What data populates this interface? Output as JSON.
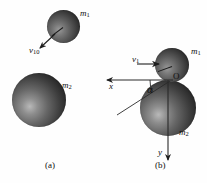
{
  "figure": {
    "type": "physics-collision-diagram"
  },
  "panel_a": {
    "caption": "(a)",
    "bodies": [
      {
        "id": "m1",
        "label": "m",
        "subscript": "1",
        "role": "small-sphere-upper-right"
      },
      {
        "id": "m2",
        "label": "m",
        "subscript": "2",
        "role": "large-sphere-lower-left"
      }
    ],
    "vectors": [
      {
        "id": "v10",
        "label": "v",
        "subscript": "10",
        "direction": "down-left",
        "from": "m1"
      }
    ]
  },
  "panel_b": {
    "caption": "(b)",
    "bodies": [
      {
        "id": "m1",
        "label": "m",
        "subscript": "1",
        "role": "small-sphere-on-top"
      },
      {
        "id": "m2",
        "label": "m",
        "subscript": "2",
        "role": "large-sphere-below"
      }
    ],
    "vectors": [
      {
        "id": "v1",
        "label": "v",
        "subscript": "1",
        "direction": "left",
        "into": "m1"
      }
    ],
    "axes": [
      {
        "id": "x",
        "label": "x",
        "direction": "left",
        "origin": "O"
      },
      {
        "id": "y",
        "label": "y",
        "direction": "down",
        "origin": "O"
      }
    ],
    "origin_label": "O",
    "angle_label": "α",
    "angle_between": [
      "x-axis",
      "line-of-centers"
    ]
  },
  "colors": {
    "sphere_dark": "#161616",
    "sphere_mid": "#666666",
    "sphere_light": "#b9b9b9",
    "line": "#2a2a2a",
    "text": "#111111",
    "background": "#ffffff"
  }
}
